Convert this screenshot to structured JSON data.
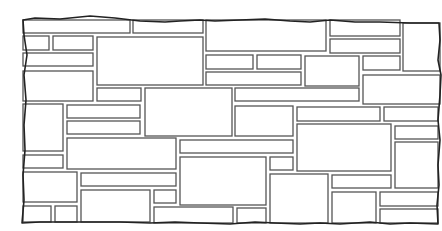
{
  "figure": {
    "width": 442,
    "height": 231,
    "colors": {
      "background": "#ffffff",
      "stone_fill": "#ffffff",
      "joint_line": "#555555",
      "edge_line": "#222222"
    },
    "outline": "M23,20 L35,18 L60,19 L90,16 L115,18 L140,21 L165,22 L180,21 L200,20 L215,21 L240,20 L265,19 L290,21 L310,22 L330,20 L355,22 L380,22 L410,23 L439,23 L440,40 L438,60 L441,75 L440,95 L438,120 L440,140 L438,165 L439,185 L437,205 L438,224 L410,223 L390,224 L370,222 L340,224 L320,223 L300,224 L275,223 L255,222 L230,224 L200,223 L175,222 L150,223 L120,222 L90,222 L60,222 L40,222 L22,223 L24,200 L23,175 L25,150 L24,125 L26,100 L24,75 L27,55 L24,35 Z",
    "stones": [
      [
        23,
        20,
        107,
        13
      ],
      [
        133,
        20,
        70,
        13
      ],
      [
        206,
        20,
        120,
        31
      ],
      [
        330,
        20,
        70,
        16
      ],
      [
        403,
        23,
        37,
        48
      ],
      [
        23,
        36,
        26,
        14
      ],
      [
        53,
        36,
        40,
        14
      ],
      [
        97,
        37,
        106,
        48
      ],
      [
        330,
        39,
        70,
        14
      ],
      [
        23,
        53,
        70,
        13
      ],
      [
        206,
        55,
        47,
        14
      ],
      [
        257,
        55,
        44,
        14
      ],
      [
        305,
        56,
        54,
        30
      ],
      [
        363,
        56,
        37,
        14
      ],
      [
        206,
        72,
        95,
        13
      ],
      [
        363,
        75,
        77,
        29
      ],
      [
        23,
        71,
        70,
        30
      ],
      [
        97,
        88,
        44,
        13
      ],
      [
        145,
        88,
        87,
        48
      ],
      [
        235,
        88,
        124,
        13
      ],
      [
        23,
        104,
        40,
        47
      ],
      [
        67,
        105,
        73,
        13
      ],
      [
        235,
        106,
        58,
        30
      ],
      [
        297,
        107,
        83,
        14
      ],
      [
        384,
        107,
        54,
        14
      ],
      [
        67,
        121,
        73,
        13
      ],
      [
        297,
        124,
        94,
        47
      ],
      [
        395,
        126,
        43,
        13
      ],
      [
        67,
        138,
        109,
        31
      ],
      [
        180,
        140,
        113,
        13
      ],
      [
        395,
        142,
        43,
        46
      ],
      [
        23,
        155,
        40,
        13
      ],
      [
        180,
        157,
        86,
        48
      ],
      [
        270,
        157,
        23,
        13
      ],
      [
        23,
        172,
        54,
        30
      ],
      [
        81,
        173,
        95,
        13
      ],
      [
        270,
        174,
        58,
        49
      ],
      [
        332,
        175,
        59,
        13
      ],
      [
        81,
        190,
        69,
        32
      ],
      [
        154,
        190,
        22,
        13
      ],
      [
        332,
        192,
        44,
        31
      ],
      [
        380,
        192,
        58,
        14
      ],
      [
        23,
        206,
        28,
        16
      ],
      [
        55,
        206,
        22,
        16
      ],
      [
        154,
        207,
        79,
        16
      ],
      [
        237,
        208,
        29,
        15
      ],
      [
        380,
        209,
        58,
        14
      ]
    ]
  }
}
